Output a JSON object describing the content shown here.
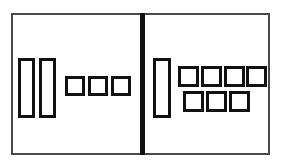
{
  "figure": {
    "canvas": {
      "width": 281,
      "height": 168,
      "background": "#ffffff"
    },
    "frame": {
      "label": "outer-frame",
      "x": 11,
      "y": 13,
      "width": 259,
      "height": 142,
      "stroke": "#4a4a4a",
      "stroke_width": 2,
      "fill": "#ffffff"
    },
    "divider": {
      "label": "center-divider",
      "x": 140,
      "y": 13,
      "width": 5,
      "height": 142,
      "color": "#111111"
    },
    "panels": [
      {
        "name": "left-panel",
        "label": "Left group",
        "shape_count": 5,
        "tall_count": 2,
        "square_count": 3,
        "shapes": [
          {
            "id": "L-tall-1",
            "kind": "tall",
            "x": 18,
            "y": 58,
            "width": 17,
            "height": 60,
            "stroke": "#111111",
            "stroke_width": 3,
            "fill": "#ffffff"
          },
          {
            "id": "L-tall-2",
            "kind": "tall",
            "x": 39,
            "y": 58,
            "width": 17,
            "height": 60,
            "stroke": "#111111",
            "stroke_width": 3,
            "fill": "#ffffff"
          },
          {
            "id": "L-sq-1",
            "kind": "square",
            "x": 65,
            "y": 76,
            "width": 20,
            "height": 20,
            "stroke": "#111111",
            "stroke_width": 3,
            "fill": "#ffffff"
          },
          {
            "id": "L-sq-2",
            "kind": "square",
            "x": 88,
            "y": 76,
            "width": 20,
            "height": 20,
            "stroke": "#111111",
            "stroke_width": 3,
            "fill": "#ffffff"
          },
          {
            "id": "L-sq-3",
            "kind": "square",
            "x": 111,
            "y": 76,
            "width": 20,
            "height": 20,
            "stroke": "#111111",
            "stroke_width": 3,
            "fill": "#ffffff"
          }
        ]
      },
      {
        "name": "right-panel",
        "label": "Right group",
        "shape_count": 8,
        "tall_count": 1,
        "square_count": 7,
        "shapes": [
          {
            "id": "R-tall-1",
            "kind": "tall",
            "x": 153,
            "y": 58,
            "width": 18,
            "height": 60,
            "stroke": "#111111",
            "stroke_width": 3,
            "fill": "#ffffff"
          },
          {
            "id": "R-sq-r1c1",
            "kind": "square",
            "x": 178,
            "y": 66,
            "width": 21,
            "height": 21,
            "stroke": "#111111",
            "stroke_width": 3,
            "fill": "#ffffff"
          },
          {
            "id": "R-sq-r1c2",
            "kind": "square",
            "x": 201,
            "y": 66,
            "width": 21,
            "height": 21,
            "stroke": "#111111",
            "stroke_width": 3,
            "fill": "#ffffff"
          },
          {
            "id": "R-sq-r1c3",
            "kind": "square",
            "x": 224,
            "y": 66,
            "width": 21,
            "height": 21,
            "stroke": "#111111",
            "stroke_width": 3,
            "fill": "#ffffff"
          },
          {
            "id": "R-sq-r1c4",
            "kind": "square",
            "x": 246,
            "y": 66,
            "width": 21,
            "height": 21,
            "stroke": "#111111",
            "stroke_width": 3,
            "fill": "#ffffff"
          },
          {
            "id": "R-sq-r2c1",
            "kind": "square",
            "x": 183,
            "y": 91,
            "width": 21,
            "height": 21,
            "stroke": "#111111",
            "stroke_width": 3,
            "fill": "#ffffff"
          },
          {
            "id": "R-sq-r2c2",
            "kind": "square",
            "x": 206,
            "y": 91,
            "width": 21,
            "height": 21,
            "stroke": "#111111",
            "stroke_width": 3,
            "fill": "#ffffff"
          },
          {
            "id": "R-sq-r2c3",
            "kind": "square",
            "x": 229,
            "y": 91,
            "width": 21,
            "height": 21,
            "stroke": "#111111",
            "stroke_width": 3,
            "fill": "#ffffff"
          }
        ]
      }
    ]
  }
}
